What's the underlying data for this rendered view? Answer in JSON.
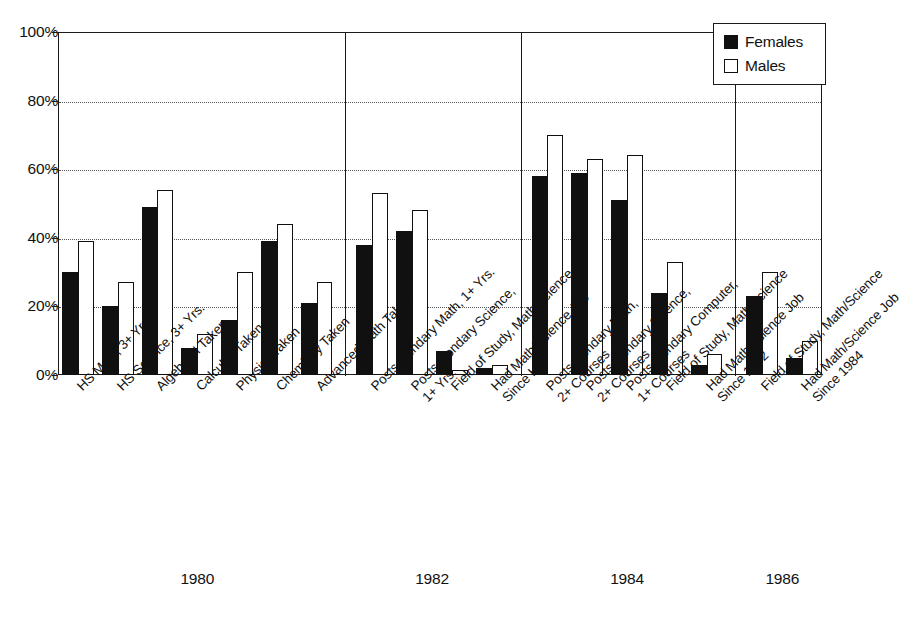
{
  "chart_data": {
    "type": "bar",
    "title": "",
    "subtitle": "",
    "xlabel": "",
    "ylabel": "",
    "ylim": [
      0,
      100
    ],
    "yticks": [
      0,
      20,
      40,
      60,
      80,
      100
    ],
    "ytick_labels": [
      "0%",
      "20%",
      "40%",
      "60%",
      "80%",
      "100%"
    ],
    "grid": "horizontal-dotted",
    "legend_position": "top-right",
    "series": [
      {
        "name": "Females",
        "color": "#101010",
        "values": [
          30,
          20,
          49,
          8,
          16,
          39,
          21,
          38,
          42,
          7,
          2,
          58,
          59,
          51,
          24,
          3,
          23,
          5
        ]
      },
      {
        "name": "Males",
        "color": "#ffffff",
        "values": [
          39,
          27,
          54,
          12,
          30,
          44,
          27,
          53,
          48,
          1.5,
          3,
          70,
          63,
          64,
          33,
          6,
          30,
          10
        ]
      }
    ],
    "categories": [
      "HS Math, 3+ Yrs.",
      "HS Science, 3+ Yrs.",
      "Algebra II Taken",
      "Calculus Taken",
      "Physics Taken",
      "Chemistry Taken",
      "Advanced Math Taken",
      "Postsecondary Math, 1+ Yrs.",
      "Postsecondary Science, 1+ Yrs.",
      "Field of Study, Math/Science",
      "Had Math/Science Job Since HS",
      "Postsecondary Math, 2+ Courses",
      "Postsecondary Science, 2+ Courses",
      "Postsecondary Computer, 1+ Courses",
      "Field of Study, Math/Science",
      "Had Math/Science Job Since 1982",
      "Field of Study, Math/Science",
      "Had Math/Science Job Since 1984"
    ],
    "category_lines": [
      [
        "HS Math, 3+ Yrs."
      ],
      [
        "HS Science, 3+ Yrs."
      ],
      [
        "Algebra II Taken"
      ],
      [
        "Calculus Taken"
      ],
      [
        "Physics Taken"
      ],
      [
        "Chemistry Taken"
      ],
      [
        "Advanced Math Taken"
      ],
      [
        "Postsecondary Math, 1+ Yrs."
      ],
      [
        "Postsecondary Science,",
        "1+ Yrs."
      ],
      [
        "Field of Study, Math/Science"
      ],
      [
        "Had Math/Science Job",
        "Since HS"
      ],
      [
        "Postsecondary Math,",
        "2+ Courses"
      ],
      [
        "Postsecondary Science,",
        "2+ Courses"
      ],
      [
        "Postsecondary Computer,",
        "1+ Courses"
      ],
      [
        "Field of Study, Math/Science"
      ],
      [
        "Had Math/Science Job",
        "Since 1982"
      ],
      [
        "Field of Study, Math/Science"
      ],
      [
        "Had Math/Science Job",
        "Since 1984"
      ]
    ],
    "groups": [
      {
        "label": "1980",
        "start": 0,
        "count": 7
      },
      {
        "label": "1982",
        "start": 7,
        "count": 4
      },
      {
        "label": "1984",
        "start": 11,
        "count": 5
      },
      {
        "label": "1986",
        "start": 16,
        "count": 2
      }
    ]
  },
  "legend": {
    "items": [
      {
        "label": "Females",
        "swatch": "filled-black-square"
      },
      {
        "label": "Males",
        "swatch": "outlined-white-square"
      }
    ]
  }
}
